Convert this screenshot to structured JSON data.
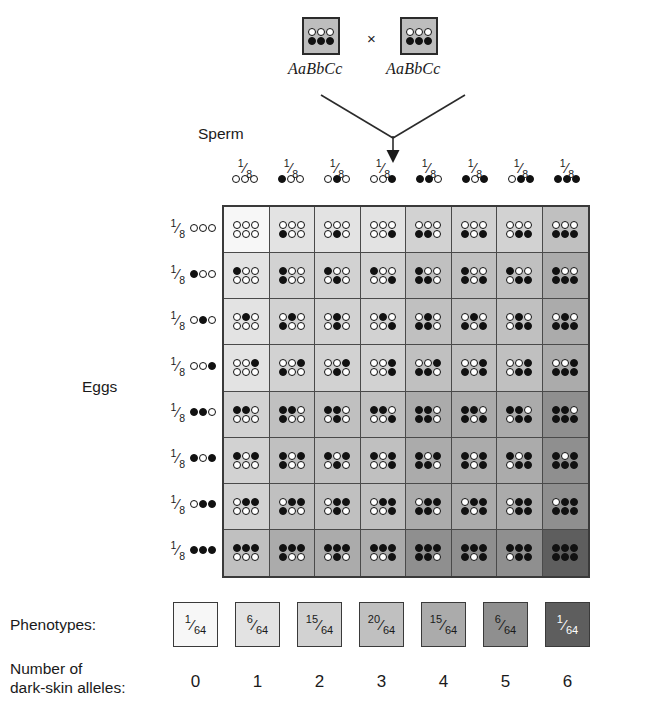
{
  "diagram": {
    "title_cross_symbol": "×",
    "parents": [
      {
        "genotype": "AaBbCc",
        "top_alleles": [
          "open",
          "open",
          "open"
        ],
        "bottom_alleles": [
          "fill",
          "fill",
          "fill"
        ]
      },
      {
        "genotype": "AaBbCc",
        "top_alleles": [
          "open",
          "open",
          "open"
        ],
        "bottom_alleles": [
          "fill",
          "fill",
          "fill"
        ]
      }
    ],
    "sperm_label": "Sperm",
    "eggs_label": "Eggs",
    "gamete_fraction": {
      "num": "1",
      "slash": "⁄",
      "den": "8"
    },
    "gametes": [
      {
        "id": "g0",
        "dots": [
          "open",
          "open",
          "open"
        ],
        "dark": 0
      },
      {
        "id": "g1",
        "dots": [
          "fill",
          "open",
          "open"
        ],
        "dark": 1
      },
      {
        "id": "g2",
        "dots": [
          "open",
          "fill",
          "open"
        ],
        "dark": 1
      },
      {
        "id": "g3",
        "dots": [
          "open",
          "open",
          "fill"
        ],
        "dark": 1
      },
      {
        "id": "g4",
        "dots": [
          "fill",
          "fill",
          "open"
        ],
        "dark": 2
      },
      {
        "id": "g5",
        "dots": [
          "fill",
          "open",
          "fill"
        ],
        "dark": 2
      },
      {
        "id": "g6",
        "dots": [
          "open",
          "fill",
          "fill"
        ],
        "dark": 2
      },
      {
        "id": "g7",
        "dots": [
          "fill",
          "fill",
          "fill"
        ],
        "dark": 3
      }
    ],
    "shade_by_dark_count": [
      "#f7f7f7",
      "#e3e3e3",
      "#d2d2d2",
      "#c0c0c0",
      "#ababab",
      "#8f8f8f",
      "#5e5e5e"
    ],
    "legend": {
      "phenotypes_label": "Phenotypes:",
      "number_label_line1": "Number of",
      "number_label_line2": "dark-skin alleles:",
      "boxes": [
        {
          "num": "1",
          "slash": "⁄",
          "den": "64",
          "dark": 0,
          "count_label": "0"
        },
        {
          "num": "6",
          "slash": "⁄",
          "den": "64",
          "dark": 1,
          "count_label": "1"
        },
        {
          "num": "15",
          "slash": "⁄",
          "den": "64",
          "dark": 2,
          "count_label": "2"
        },
        {
          "num": "20",
          "slash": "⁄",
          "den": "64",
          "dark": 3,
          "count_label": "3"
        },
        {
          "num": "15",
          "slash": "⁄",
          "den": "64",
          "dark": 4,
          "count_label": "4"
        },
        {
          "num": "6",
          "slash": "⁄",
          "den": "64",
          "dark": 5,
          "count_label": "5"
        },
        {
          "num": "1",
          "slash": "⁄",
          "den": "64",
          "dark": 6,
          "count_label": "6"
        }
      ]
    },
    "colors": {
      "dot_fill": "#111111",
      "dot_open": "#ffffff",
      "grid_border": "#3a3a3a",
      "parent_box_fill": "#bdbdbd"
    }
  }
}
